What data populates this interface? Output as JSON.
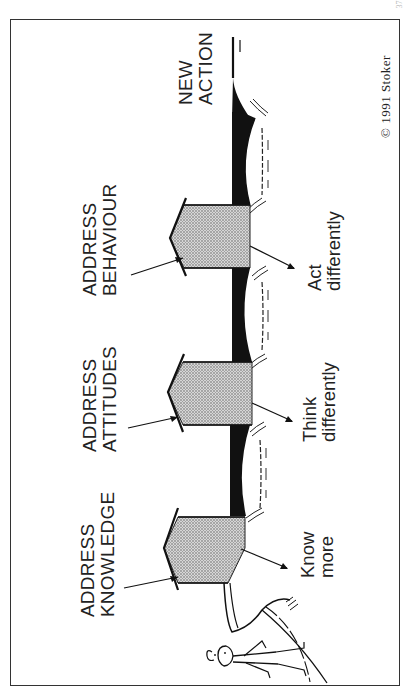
{
  "page": {
    "number": "37"
  },
  "diagram": {
    "title": "",
    "stages": [
      {
        "id": "knowledge",
        "address_label": [
          "ADDRESS",
          "KNOWLEDGE"
        ],
        "outcome_label": [
          "Know",
          "more"
        ]
      },
      {
        "id": "attitudes",
        "address_label": [
          "ADDRESS",
          "ATTITUDES"
        ],
        "outcome_label": [
          "Think",
          "differently"
        ]
      },
      {
        "id": "behaviour",
        "address_label": [
          "ADDRESS",
          "BEHAVIOUR"
        ],
        "outcome_label": [
          "Act",
          "differently"
        ]
      }
    ],
    "goal_label": [
      "NEW",
      "ACTION"
    ],
    "start_figure": {
      "symbol": "?",
      "description": "confused stick figure"
    },
    "copyright": "© 1991  Stoker",
    "colors": {
      "ink": "#1a1a1a",
      "pier_fill": "#bdbdbd",
      "deck": "#111111",
      "paper": "#ffffff"
    }
  }
}
